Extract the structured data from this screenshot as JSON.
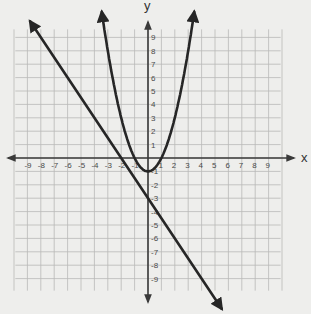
{
  "graph": {
    "x_axis_label": "x",
    "y_axis_label": "y",
    "x_ticks": [
      "-9",
      "-8",
      "-7",
      "-6",
      "-5",
      "-4",
      "-3",
      "-2",
      "-1",
      "1",
      "2",
      "3",
      "4",
      "5",
      "6",
      "7",
      "8",
      "9"
    ],
    "y_ticks_positive": [
      "9",
      "8",
      "7",
      "6",
      "5",
      "4",
      "3",
      "2",
      "1"
    ],
    "y_ticks_negative": [
      "-1",
      "-2",
      "-3",
      "-4",
      "-5",
      "-6",
      "-7",
      "-8",
      "-9"
    ],
    "range": {
      "xmin": -9,
      "xmax": 9,
      "ymin": -9,
      "ymax": 9
    },
    "grid": true,
    "colors": {
      "background": "#eeeeec",
      "grid": "#b9b9b7",
      "curve": "#262626",
      "axis": "#3a3a3a"
    }
  },
  "chart_data": {
    "type": "line",
    "title": "",
    "xlabel": "x",
    "ylabel": "y",
    "xlim": [
      -9,
      9
    ],
    "ylim": [
      -9,
      9
    ],
    "grid": true,
    "series": [
      {
        "name": "parabola",
        "equation": "y = x^2 - 1",
        "vertex": [
          0,
          -1
        ],
        "x_intercepts": [
          -1,
          1
        ],
        "y_intercept": -1,
        "x": [
          -3.4,
          -3,
          -2,
          -1,
          0,
          1,
          2,
          3,
          3.4
        ],
        "y": [
          10.56,
          8,
          3,
          0,
          -1,
          0,
          3,
          8,
          10.56
        ]
      },
      {
        "name": "line",
        "equation": "y = -1.5x - 3",
        "slope": -1.5,
        "x_intercept": -2,
        "y_intercept": -3,
        "x": [
          -8.8,
          -2,
          0,
          5.5
        ],
        "y": [
          10.2,
          0,
          -3,
          -11.25
        ]
      }
    ],
    "intersections_approx": [
      [
        -1.5,
        1.25
      ],
      [
        -1.5,
        1.25
      ]
    ]
  }
}
